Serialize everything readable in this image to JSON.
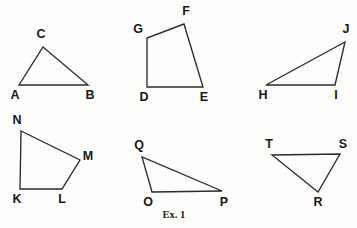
{
  "figure": {
    "caption": "Ex. 1",
    "caption_position": {
      "x": 174,
      "y": 216
    },
    "stroke_color": "#2b2b2b",
    "label_color": "#171717",
    "background_color": "#fdfdfc",
    "width": 357,
    "height": 228
  },
  "shapes": [
    {
      "id": "triangle-abc",
      "name": "triangle ABC",
      "type": "triangle",
      "closed": true,
      "points": "19,85 88,85 43,47",
      "vertices": [
        {
          "label": "A",
          "x": 19,
          "y": 85,
          "label_x": 15,
          "label_y": 96,
          "anchor": "middle"
        },
        {
          "label": "B",
          "x": 88,
          "y": 85,
          "label_x": 90,
          "label_y": 96,
          "anchor": "middle"
        },
        {
          "label": "C",
          "x": 43,
          "y": 47,
          "label_x": 41,
          "label_y": 35,
          "anchor": "middle"
        }
      ]
    },
    {
      "id": "quadrilateral-defg",
      "name": "quadrilateral DEFG",
      "type": "quadrilateral",
      "closed": true,
      "points": "147,87 203,87 184,24 147,38",
      "vertices": [
        {
          "label": "D",
          "x": 147,
          "y": 87,
          "label_x": 144,
          "label_y": 98,
          "anchor": "middle"
        },
        {
          "label": "E",
          "x": 203,
          "y": 87,
          "label_x": 204,
          "label_y": 98,
          "anchor": "middle"
        },
        {
          "label": "F",
          "x": 184,
          "y": 24,
          "label_x": 186,
          "label_y": 12,
          "anchor": "middle"
        },
        {
          "label": "G",
          "x": 147,
          "y": 38,
          "label_x": 138,
          "label_y": 30,
          "anchor": "middle"
        }
      ]
    },
    {
      "id": "triangle-hij",
      "name": "triangle HIJ",
      "type": "triangle",
      "closed": true,
      "points": "266,85 335,85 345,42",
      "vertices": [
        {
          "label": "H",
          "x": 266,
          "y": 85,
          "label_x": 263,
          "label_y": 96,
          "anchor": "middle"
        },
        {
          "label": "I",
          "x": 335,
          "y": 85,
          "label_x": 336,
          "label_y": 96,
          "anchor": "middle"
        },
        {
          "label": "J",
          "x": 345,
          "y": 42,
          "label_x": 346,
          "label_y": 30,
          "anchor": "middle"
        }
      ]
    },
    {
      "id": "quadrilateral-klmn",
      "name": "quadrilateral KLMN",
      "type": "quadrilateral",
      "closed": true,
      "points": "20,189 62,189 80,160 21,131",
      "vertices": [
        {
          "label": "K",
          "x": 20,
          "y": 189,
          "label_x": 17,
          "label_y": 200,
          "anchor": "middle"
        },
        {
          "label": "L",
          "x": 62,
          "y": 189,
          "label_x": 62,
          "label_y": 200,
          "anchor": "middle"
        },
        {
          "label": "M",
          "x": 80,
          "y": 160,
          "label_x": 88,
          "label_y": 157,
          "anchor": "middle"
        },
        {
          "label": "N",
          "x": 21,
          "y": 131,
          "label_x": 17,
          "label_y": 121,
          "anchor": "middle"
        }
      ]
    },
    {
      "id": "triangle-opq",
      "name": "triangle OPQ",
      "type": "triangle",
      "closed": true,
      "points": "152,192 222,191 142,157",
      "vertices": [
        {
          "label": "O",
          "x": 152,
          "y": 192,
          "label_x": 148,
          "label_y": 203,
          "anchor": "middle"
        },
        {
          "label": "P",
          "x": 222,
          "y": 191,
          "label_x": 224,
          "label_y": 203,
          "anchor": "middle"
        },
        {
          "label": "Q",
          "x": 142,
          "y": 157,
          "label_x": 139,
          "label_y": 146,
          "anchor": "middle"
        }
      ]
    },
    {
      "id": "triangle-rst",
      "name": "triangle RST",
      "type": "triangle",
      "closed": true,
      "points": "272,155 340,154 318,192",
      "vertices": [
        {
          "label": "T",
          "x": 272,
          "y": 155,
          "label_x": 269,
          "label_y": 145,
          "anchor": "middle"
        },
        {
          "label": "S",
          "x": 340,
          "y": 154,
          "label_x": 343,
          "label_y": 145,
          "anchor": "middle"
        },
        {
          "label": "R",
          "x": 318,
          "y": 192,
          "label_x": 318,
          "label_y": 203,
          "anchor": "middle"
        }
      ]
    }
  ]
}
